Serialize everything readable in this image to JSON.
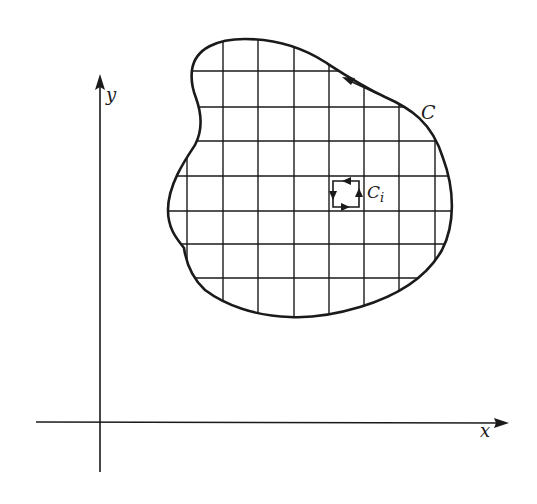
{
  "figure": {
    "colors": {
      "ink": "#1a1a1a",
      "background": "#ffffff"
    }
  },
  "labels": {
    "y_axis": "y",
    "x_axis": "x",
    "curve": "C",
    "cell_curve": "C",
    "cell_curve_subscript": "i"
  },
  "axes": {
    "x_axis": {
      "from": [
        36,
        423
      ],
      "to": [
        508,
        423
      ],
      "arrow": "right"
    },
    "y_axis": {
      "from": [
        100,
        472
      ],
      "to": [
        100,
        75
      ],
      "arrow": "up"
    }
  },
  "grid": {
    "vertical_lines_x": [
      187,
      223,
      258,
      294,
      329,
      364,
      399,
      435
    ],
    "horizontal_lines_y": [
      71,
      107,
      141,
      176,
      211,
      244,
      278
    ]
  },
  "orientation": {
    "boundary_direction": "counterclockwise",
    "cell_direction": "counterclockwise"
  }
}
